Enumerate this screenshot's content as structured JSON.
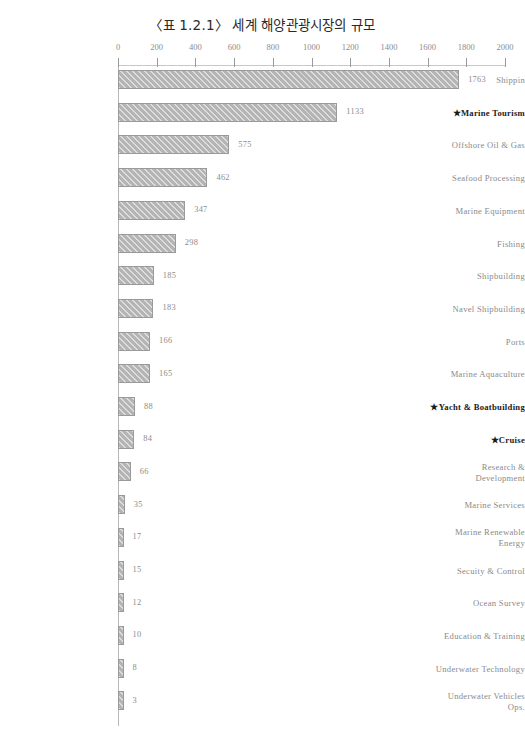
{
  "chart_data": {
    "type": "bar",
    "orientation": "horizontal",
    "title": "〈표 1.2.1〉 세계 해양관광시장의 규모",
    "xlabel": "",
    "ylabel": "",
    "xlim": [
      0,
      2000
    ],
    "xticks": [
      0,
      200,
      400,
      600,
      800,
      1000,
      1200,
      1400,
      1600,
      1800,
      2000
    ],
    "xtick_labels": [
      "0",
      "200",
      "400",
      "600",
      "800",
      "1000",
      "1200",
      "1400",
      "1600",
      "1800",
      "2000"
    ],
    "grid": false,
    "legend": false,
    "bar_color": "#b4b4b4",
    "bar_edge_color": "#9a9a9a",
    "bar_hatch": "diagonal",
    "categories": [
      "Shippin",
      "★Marine Tourism",
      "Offshore Oil & Gas",
      "Seafood Processing",
      "Marine Equipment",
      "Fishing",
      "Shipbuilding",
      "Navel Shipbuilding",
      "Ports",
      "Marine Aquaculture",
      "★Yacht & Boatbuilding",
      "★Cruise",
      "Research &\nDevelopment",
      "Marine Services",
      "Marine Renewable\nEnergy",
      "Secuity & Control",
      "Ocean Survey",
      "Education & Training",
      "Underwater Technology",
      "Underwater Vehicles\nOps."
    ],
    "values": [
      1763,
      1133,
      575,
      462,
      347,
      298,
      185,
      183,
      166,
      165,
      88,
      84,
      66,
      35,
      17,
      15,
      12,
      10,
      8,
      3
    ],
    "value_labels": [
      "1763",
      "1133",
      "575",
      "462",
      "347",
      "298",
      "185",
      "183",
      "166",
      "165",
      "88",
      "84",
      "66",
      "35",
      "17",
      "15",
      "12",
      "10",
      "8",
      "3"
    ],
    "highlighted": [
      false,
      true,
      false,
      false,
      false,
      false,
      false,
      false,
      false,
      false,
      true,
      true,
      false,
      false,
      false,
      false,
      false,
      false,
      false,
      false
    ]
  }
}
